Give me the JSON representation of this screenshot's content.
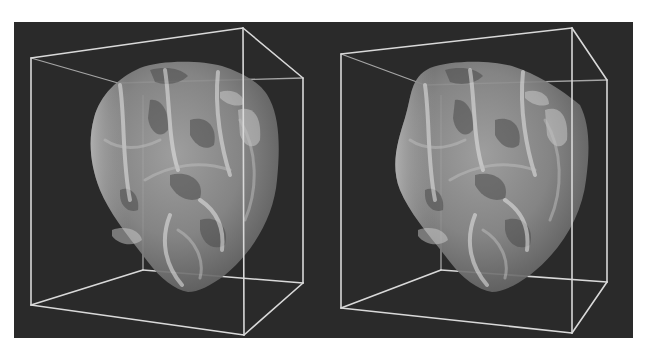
{
  "figure": {
    "views": [
      {
        "id": "left",
        "label": "Left stereo view"
      },
      {
        "id": "right",
        "label": "Right stereo view"
      }
    ]
  },
  "colors": {
    "background": "#2a2a2a",
    "page": "#ffffff",
    "wireframe": "#d9d9d9",
    "heart_light": "#d0d0d0",
    "heart_mid": "#9a9a9a",
    "heart_dark": "#555555"
  }
}
